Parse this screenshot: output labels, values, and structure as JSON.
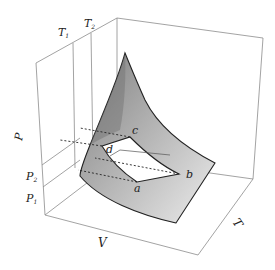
{
  "diagram": {
    "type": "3d-pvt-surface",
    "axes": {
      "p_label": "P",
      "v_label": "V",
      "t_label": "T"
    },
    "pressure_ticks": [
      {
        "label": "P",
        "sub": "2"
      },
      {
        "label": "P",
        "sub": "1"
      }
    ],
    "temperature_ticks": [
      {
        "label": "T",
        "sub": "1"
      },
      {
        "label": "T",
        "sub": "2"
      }
    ],
    "cycle_points": [
      {
        "id": "a",
        "label": "a"
      },
      {
        "id": "b",
        "label": "b"
      },
      {
        "id": "c",
        "label": "c"
      },
      {
        "id": "d",
        "label": "d"
      }
    ],
    "colors": {
      "surface_dark": "#8a8a8a",
      "surface_light": "#e4e4e4",
      "box_line": "#888888",
      "edge": "#222222"
    }
  }
}
